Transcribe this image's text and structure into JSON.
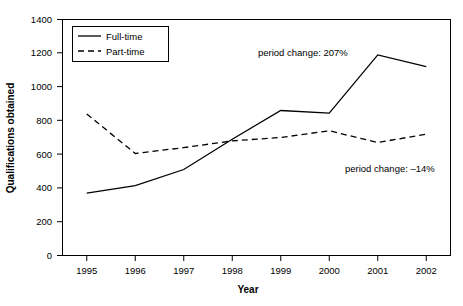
{
  "chart_data": {
    "type": "line",
    "title": "",
    "xlabel": "Year",
    "ylabel": "Qualifications obtained",
    "categories": [
      "1995",
      "1996",
      "1997",
      "1998",
      "1999",
      "2000",
      "2001",
      "2002"
    ],
    "series": [
      {
        "name": "Full-time",
        "style": "solid",
        "values": [
          370,
          415,
          510,
          690,
          860,
          845,
          1190,
          1120
        ]
      },
      {
        "name": "Part-time",
        "style": "dashed",
        "values": [
          840,
          605,
          640,
          680,
          700,
          740,
          670,
          720
        ]
      }
    ],
    "ylim": [
      0,
      1400
    ],
    "ytick_step": 200,
    "yticks": [
      "0",
      "200",
      "400",
      "600",
      "800",
      "1000",
      "1200",
      "1400"
    ],
    "grid": false,
    "legend_position": "top-left-inside",
    "annotations": [
      {
        "name": "full-time-period-change",
        "text": "period change: 207%",
        "x": 258,
        "y": 56
      },
      {
        "name": "part-time-period-change",
        "text": "period change: –14%",
        "x": 345,
        "y": 172
      }
    ],
    "colors": {
      "line": "#000000",
      "background": "#ffffff",
      "border": "#000000"
    }
  },
  "legend": {
    "entries": [
      {
        "label": "Full-time"
      },
      {
        "label": "Part-time"
      }
    ]
  }
}
